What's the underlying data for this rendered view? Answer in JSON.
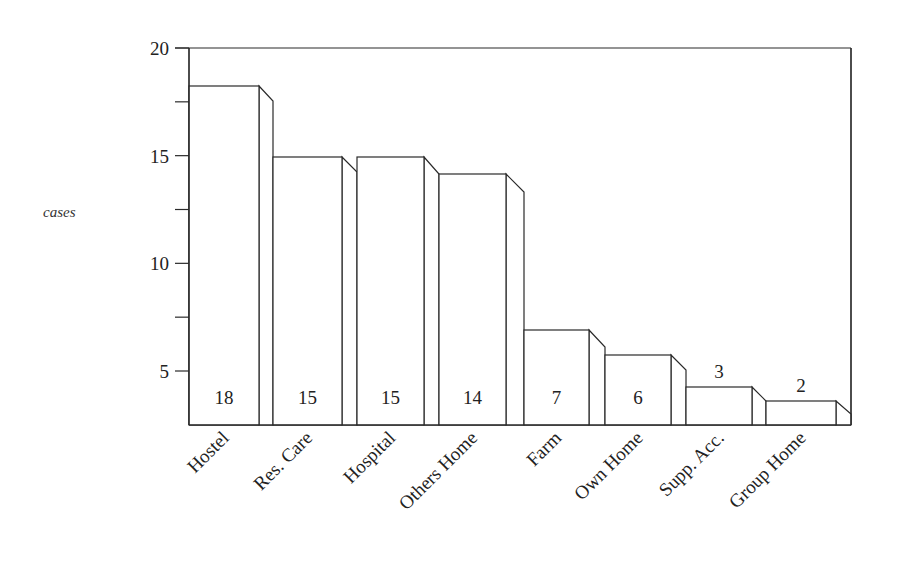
{
  "chart_data": {
    "type": "bar",
    "title": "",
    "xlabel": "",
    "ylabel": "cases",
    "ylim": [
      2.5,
      20
    ],
    "grid": false,
    "legend": null,
    "style": "3d-stepped bars with value labels at bar bottom",
    "categories": [
      "Hostel",
      "Res. Care",
      "Hospital",
      "Others Home",
      "Farm",
      "Own Home",
      "Supp. Acc.",
      "Group Home"
    ],
    "values": [
      18,
      15,
      15,
      14,
      7,
      6,
      3,
      2
    ],
    "value_labels": [
      "18",
      "15",
      "15",
      "14",
      "7",
      "6",
      "3",
      "2"
    ],
    "y_ticks": [
      {
        "value": 20,
        "label": "20"
      },
      {
        "value": 17.5,
        "label": ""
      },
      {
        "value": 15,
        "label": "15"
      },
      {
        "value": 12.5,
        "label": ""
      },
      {
        "value": 10,
        "label": "10"
      },
      {
        "value": 7.5,
        "label": ""
      },
      {
        "value": 5,
        "label": "5"
      }
    ]
  },
  "geometry": {
    "plot": {
      "left": 189,
      "right": 851,
      "top": 48,
      "bottom": 425
    },
    "y_px": {
      "v20": 48,
      "v5": 371
    },
    "bars": [
      {
        "x0": 189,
        "x1": 259,
        "x2": 273,
        "top": 86,
        "sideBottom": 101,
        "labelY": 404,
        "labelAbove": false
      },
      {
        "x0": 273,
        "x1": 342,
        "x2": 357,
        "top": 157,
        "sideBottom": 172,
        "labelY": 404,
        "labelAbove": false
      },
      {
        "x0": 357,
        "x1": 424,
        "x2": 439,
        "top": 157,
        "sideBottom": 174,
        "labelY": 404,
        "labelAbove": false
      },
      {
        "x0": 439,
        "x1": 506,
        "x2": 524,
        "top": 174,
        "sideBottom": 192,
        "labelY": 404,
        "labelAbove": false
      },
      {
        "x0": 524,
        "x1": 589,
        "x2": 605,
        "top": 330,
        "sideBottom": 347,
        "labelY": 404,
        "labelAbove": false
      },
      {
        "x0": 605,
        "x1": 671,
        "x2": 686,
        "top": 355,
        "sideBottom": 370,
        "labelY": 404,
        "labelAbove": false
      },
      {
        "x0": 686,
        "x1": 752,
        "x2": 766,
        "top": 387,
        "sideBottom": 401,
        "labelY": 378,
        "labelAbove": true
      },
      {
        "x0": 766,
        "x1": 836,
        "x2": 851,
        "top": 401,
        "sideBottom": 414,
        "labelY": 392,
        "labelAbove": true
      }
    ]
  }
}
